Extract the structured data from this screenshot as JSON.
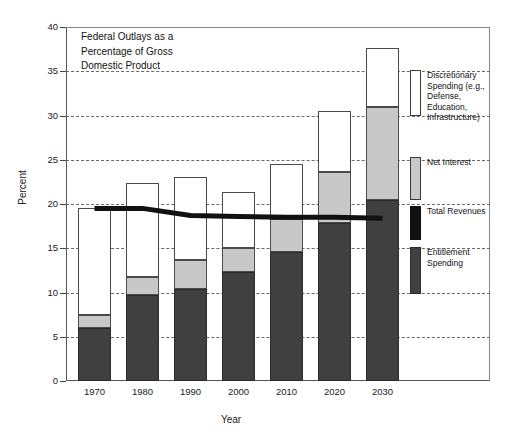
{
  "chart_data": {
    "type": "bar",
    "title": "Federal Outlays as a\nPercentage of Gross\nDomestic Product",
    "xlabel": "Year",
    "ylabel": "Percent",
    "ylim": [
      0,
      40
    ],
    "ytick_step": 5,
    "yticks": [
      "0",
      "5",
      "10",
      "15",
      "20",
      "25",
      "30",
      "35",
      "40"
    ],
    "categories": [
      "1970",
      "1980",
      "1990",
      "2000",
      "2010",
      "2020",
      "2030"
    ],
    "stacked": true,
    "grid": "horizontal-dashed",
    "legend_position": "right-inside",
    "series": [
      {
        "name": "Entitlement Spending",
        "color": "#404040",
        "values": [
          6.0,
          9.7,
          10.4,
          12.3,
          14.6,
          17.8,
          20.5
        ]
      },
      {
        "name": "Net Interest",
        "color": "#c8c8c8",
        "values": [
          1.5,
          2.0,
          3.3,
          2.7,
          3.7,
          5.8,
          10.5
        ]
      },
      {
        "name": "Discretionary Spending (e.g., Defense, Education, Infrastructure)",
        "color": "#ffffff",
        "values": [
          12.1,
          10.7,
          9.3,
          6.4,
          6.2,
          6.9,
          6.6
        ]
      }
    ],
    "totals": [
      19.6,
      22.4,
      23.0,
      21.4,
      24.5,
      30.5,
      37.6
    ],
    "overlay_line": {
      "name": "Total Revenues",
      "color": "#111111",
      "values": [
        19.5,
        19.5,
        18.7,
        18.6,
        18.5,
        18.5,
        18.4
      ]
    }
  },
  "legend": {
    "items": [
      {
        "key": "discretionary",
        "label": "Discretionary\nSpending (e.g.,\nDefense,\nEducation,\nInfrastructure)"
      },
      {
        "key": "interest",
        "label": "Net Interest"
      },
      {
        "key": "revenue",
        "label": "Total Revenues"
      },
      {
        "key": "entitlement",
        "label": "Entitlement\nSpending"
      }
    ]
  }
}
